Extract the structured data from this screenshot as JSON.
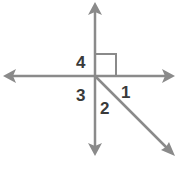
{
  "diagram": {
    "type": "intersecting-lines-angles",
    "line_color": "#8a8a8a",
    "label_color": "#3a3a3a",
    "center": [
      95,
      76
    ],
    "lines": [
      {
        "name": "horizontal-line",
        "from": [
          3,
          76
        ],
        "to": [
          175,
          76
        ],
        "arrows": "both"
      },
      {
        "name": "vertical-line",
        "from": [
          95,
          2
        ],
        "to": [
          95,
          156
        ],
        "arrows": "both"
      },
      {
        "name": "diagonal-ray",
        "from": [
          95,
          76
        ],
        "to": [
          175,
          156
        ],
        "arrows": "end"
      }
    ],
    "right_angle_marker": {
      "x": 95,
      "y": 54,
      "size": 21,
      "angle": "4"
    },
    "labels": [
      {
        "text": "4",
        "x": 76,
        "y": 68
      },
      {
        "text": "3",
        "x": 76,
        "y": 101
      },
      {
        "text": "2",
        "x": 100,
        "y": 114
      },
      {
        "text": "1",
        "x": 121,
        "y": 98
      }
    ]
  }
}
